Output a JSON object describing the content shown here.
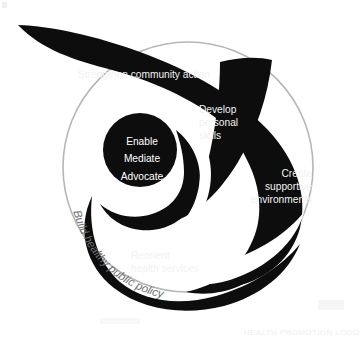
{
  "figure": {
    "background_color": "#ffffff",
    "shape_color": "#0d0d0d",
    "outline_color": "#b3b3b3",
    "label_color": "#f2f2f2",
    "curved_label_color": "#6f6f6f"
  },
  "action_areas": {
    "strengthen_community_action": "Strengthen community action",
    "develop_personal_skills": {
      "line1": "Develop",
      "line2": "personal",
      "line3": "skills"
    },
    "create_supportive_environments": {
      "line1": "Create",
      "line2": "supportive",
      "line3": "environments"
    },
    "reorient_health_services": {
      "line1": "Reorient",
      "line2": "health services"
    },
    "build_healthy_public_policy": "Build healthy public policy"
  },
  "core_strategies": {
    "enable": "Enable",
    "mediate": "Mediate",
    "advocate": "Advocate"
  },
  "caption": {
    "text": "HEALTH PROMOTION LOGO"
  }
}
